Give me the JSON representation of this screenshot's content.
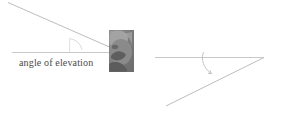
{
  "figure": {
    "width": 296,
    "height": 117,
    "background": "#ffffff",
    "line_color": "#b9b9bd",
    "text_color": "#4a4a4a"
  },
  "panels": [
    {
      "id": "elevation",
      "caption": "angle of elevation",
      "angle_marker": "arc",
      "horizontal_line": {
        "x1": 12,
        "y1": 52,
        "x2": 122,
        "y2": 52
      },
      "sight_line": {
        "x1": 8,
        "y1": 2,
        "x2": 122,
        "y2": 52
      },
      "vertex": {
        "x": 69,
        "y": 52
      },
      "observer_photo": "person-photo"
    },
    {
      "id": "depression",
      "caption": "angle of depression",
      "angle_marker": "curved-arrow",
      "horizontal_line": {
        "x1": 155,
        "y1": 57,
        "x2": 264,
        "y2": 57
      },
      "sight_line": {
        "x1": 166,
        "y1": 106,
        "x2": 264,
        "y2": 57
      },
      "vertex": {
        "x": 264,
        "y": 57
      },
      "arrow": {
        "from_x": 204,
        "from_y": 52,
        "to_x": 212,
        "to_y": 74
      },
      "observer_photo": "person-photo"
    }
  ]
}
